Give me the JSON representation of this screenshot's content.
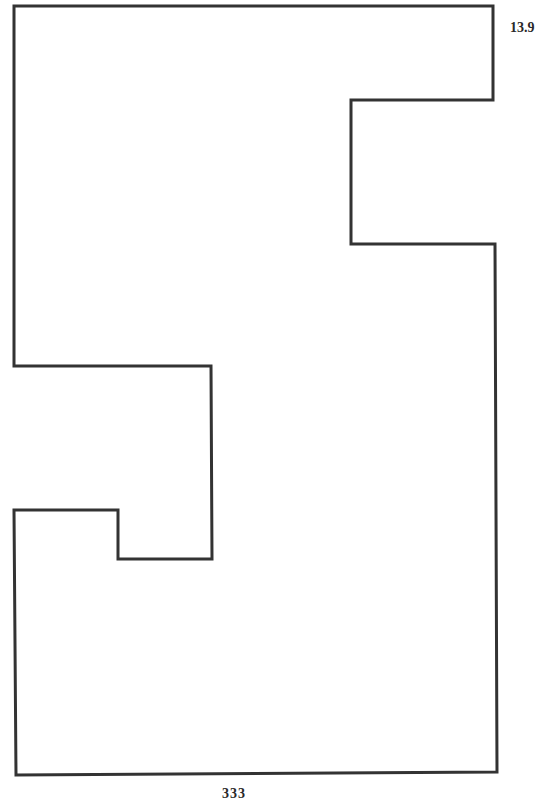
{
  "figure": {
    "label": "13.9",
    "stroke_color": "#333333",
    "stroke_width": 3,
    "outline_points": "14,6 493,6 493,100 351,100 351,244 495,244 497,772 16,775 14,510 118,510 118,559 212,559 211,366 14,366 14,6"
  },
  "page": {
    "number": "333"
  }
}
